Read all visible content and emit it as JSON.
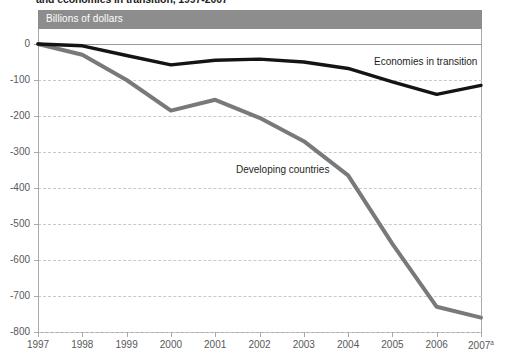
{
  "document": {
    "title_clipped": "and economies in transition, 1997-2007"
  },
  "figure": {
    "units_band_label": "Billions of dollars",
    "units_band_color": "#8d8d8d"
  },
  "chart_data": {
    "type": "line",
    "title": "Billions of dollars",
    "xlabel": "",
    "ylabel": "Billions of dollars",
    "categories": [
      "1997",
      "1998",
      "1999",
      "2000",
      "2001",
      "2002",
      "2003",
      "2004",
      "2005",
      "2006",
      "2007"
    ],
    "x_tick_labels": [
      "1997",
      "1998",
      "1999",
      "2000",
      "2001",
      "2002",
      "2003",
      "2004",
      "2005",
      "2006",
      "2007"
    ],
    "x_tick_superscripts": [
      "",
      "",
      "",
      "",
      "",
      "",
      "",
      "",
      "",
      "",
      "a"
    ],
    "y_tick_labels": [
      "0",
      "-100",
      "-200",
      "-300",
      "-400",
      "-500",
      "-600",
      "-700",
      "-800"
    ],
    "y_tick_values": [
      0,
      -100,
      -200,
      -300,
      -400,
      -500,
      -600,
      -700,
      -800
    ],
    "ylim": [
      -800,
      0
    ],
    "grid": "horizontal-dashed",
    "legend": "inline-annotations",
    "series": [
      {
        "name": "Economies in transition",
        "color": "#141414",
        "values": [
          0,
          -5,
          -32,
          -58,
          -45,
          -42,
          -50,
          -68,
          -105,
          -140,
          -115
        ]
      },
      {
        "name": "Developing countries",
        "color": "#797979",
        "values": [
          0,
          -30,
          -100,
          -185,
          -155,
          -205,
          -270,
          -365,
          -555,
          -730,
          -760
        ]
      }
    ],
    "annotations": [
      {
        "text": "Economies in transition",
        "series": "Economies in transition"
      },
      {
        "text": "Developing countries",
        "series": "Developing countries"
      }
    ]
  }
}
